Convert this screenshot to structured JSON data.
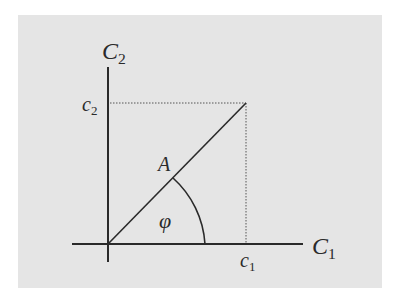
{
  "diagram": {
    "background_color": "#e5e5e5",
    "line_color": "#2a2a2a",
    "axes": {
      "x_axis": {
        "label": "C",
        "label_sub": "1"
      },
      "y_axis": {
        "label": "C",
        "label_sub": "2"
      }
    },
    "vector": {
      "label": "A"
    },
    "components": {
      "x_component": {
        "label": "c",
        "label_sub": "1"
      },
      "y_component": {
        "label": "c",
        "label_sub": "2"
      }
    },
    "angle": {
      "label": "φ"
    }
  }
}
